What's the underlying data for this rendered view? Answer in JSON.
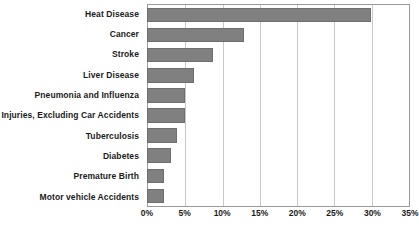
{
  "chart_data": {
    "type": "bar",
    "orientation": "horizontal",
    "title": "",
    "subtitle": "",
    "xlabel": "",
    "ylabel": "",
    "categories": [
      "Heat Disease",
      "Cancer",
      "Stroke",
      "Liver Disease",
      "Pneumonia and Influenza",
      "Injuries, Excluding Car Accidents",
      "Tuberculosis",
      "Diabetes",
      "Premature Birth",
      "Motor vehicle Accidents"
    ],
    "values": [
      30,
      13,
      8.8,
      6.3,
      5.1,
      5.1,
      4,
      3.2,
      2.3,
      2.3
    ],
    "value_unit": "%",
    "xlim": [
      0,
      35
    ],
    "xticks": [
      0,
      5,
      10,
      15,
      20,
      25,
      30,
      35
    ],
    "xtick_labels": [
      "0%",
      "5%",
      "10%",
      "15%",
      "20%",
      "25%",
      "30%",
      "35%"
    ],
    "grid": "vertical",
    "legend": "none",
    "bar_color": "#808080",
    "bar_border_color": "#6e6e6e",
    "gridline_color": "#c8c8c8",
    "axis_color": "#9a9a9a",
    "background_color": "#ffffff",
    "text_color": "#1b1b1b"
  }
}
